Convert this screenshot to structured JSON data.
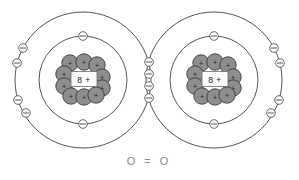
{
  "diagram": {
    "type": "bohr-model-covalent-bond",
    "title_text": "",
    "background_color": "#ffffff",
    "line_color": "#555558",
    "nucleon_fill": "#8e8e90",
    "nucleon_stroke": "#3a3a3c",
    "electron_fill": "#ffffff",
    "formula_color": "#8b8b8e",
    "atoms": [
      {
        "id": "left-oxygen-atom",
        "nucleus_label": "8 +",
        "center_x": 83,
        "center_y": 80,
        "inner_shell_radius": 44,
        "outer_shell_radius": 68,
        "nucleon_count": 10,
        "nucleon_sign": "+",
        "nucleons": [
          {
            "x": 70,
            "y": 63
          },
          {
            "x": 84,
            "y": 62
          },
          {
            "x": 97,
            "y": 65
          },
          {
            "x": 64,
            "y": 74
          },
          {
            "x": 102,
            "y": 77
          },
          {
            "x": 64,
            "y": 86
          },
          {
            "x": 102,
            "y": 88
          },
          {
            "x": 71,
            "y": 96
          },
          {
            "x": 84,
            "y": 97
          },
          {
            "x": 96,
            "y": 95
          }
        ],
        "inner_shell_electrons": [
          {
            "label": "inner-top",
            "angle_deg": 270
          },
          {
            "label": "inner-bottom",
            "angle_deg": 90
          }
        ],
        "outer_shell_electrons": [
          {
            "label": "outer-upper-left-a",
            "angle_deg": 208
          },
          {
            "label": "outer-upper-left-b",
            "angle_deg": 194
          },
          {
            "label": "outer-lower-left-a",
            "angle_deg": 166
          },
          {
            "label": "outer-lower-left-b",
            "angle_deg": 152
          }
        ]
      },
      {
        "id": "right-oxygen-atom",
        "nucleus_label": "8 +",
        "center_x": 214,
        "center_y": 80,
        "inner_shell_radius": 44,
        "outer_shell_radius": 68,
        "nucleon_count": 10,
        "nucleon_sign": "+",
        "nucleons": [
          {
            "x": 201,
            "y": 63
          },
          {
            "x": 215,
            "y": 62
          },
          {
            "x": 228,
            "y": 65
          },
          {
            "x": 195,
            "y": 74
          },
          {
            "x": 233,
            "y": 77
          },
          {
            "x": 195,
            "y": 86
          },
          {
            "x": 233,
            "y": 88
          },
          {
            "x": 202,
            "y": 96
          },
          {
            "x": 215,
            "y": 97
          },
          {
            "x": 227,
            "y": 95
          }
        ],
        "inner_shell_electrons": [
          {
            "label": "inner-top",
            "angle_deg": 270
          },
          {
            "label": "inner-bottom",
            "angle_deg": 90
          }
        ],
        "outer_shell_electrons": [
          {
            "label": "outer-upper-right-a",
            "angle_deg": 332
          },
          {
            "label": "outer-upper-right-b",
            "angle_deg": 346
          },
          {
            "label": "outer-lower-right-a",
            "angle_deg": 14
          },
          {
            "label": "outer-lower-right-b",
            "angle_deg": 28
          }
        ]
      }
    ],
    "shared_electrons": {
      "label": "shared-electron-pair-column",
      "count": 4,
      "positions": [
        {
          "x": 149,
          "y": 62
        },
        {
          "x": 149,
          "y": 74
        },
        {
          "x": 149,
          "y": 86
        },
        {
          "x": 149,
          "y": 98
        }
      ]
    },
    "formula": {
      "label": "oxygen-double-bond-formula",
      "text": "O = O",
      "x": 149,
      "y": 161
    }
  }
}
